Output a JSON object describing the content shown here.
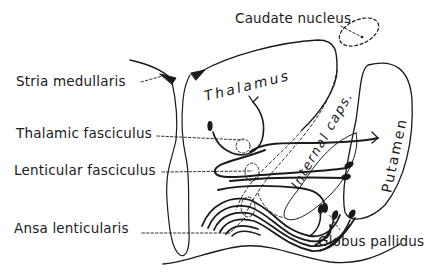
{
  "diagram": {
    "colors": {
      "ink": "#1a1a1a",
      "background": "#ffffff"
    },
    "labels": {
      "caudate_nucleus": "Caudate nucleus",
      "stria_medullaris": "Stria medullaris",
      "thalamic_fasciculus": "Thalamic fasciculus",
      "lenticular_fasciculus": "Lenticular fasciculus",
      "ansa_lenticularis": "Ansa lenticularis",
      "globus_pallidus": "Globus pallidus"
    },
    "structure_labels": {
      "thalamus": "Thalamus",
      "internal_capsule": "Internal caps.",
      "putamen": "Putamen"
    }
  }
}
